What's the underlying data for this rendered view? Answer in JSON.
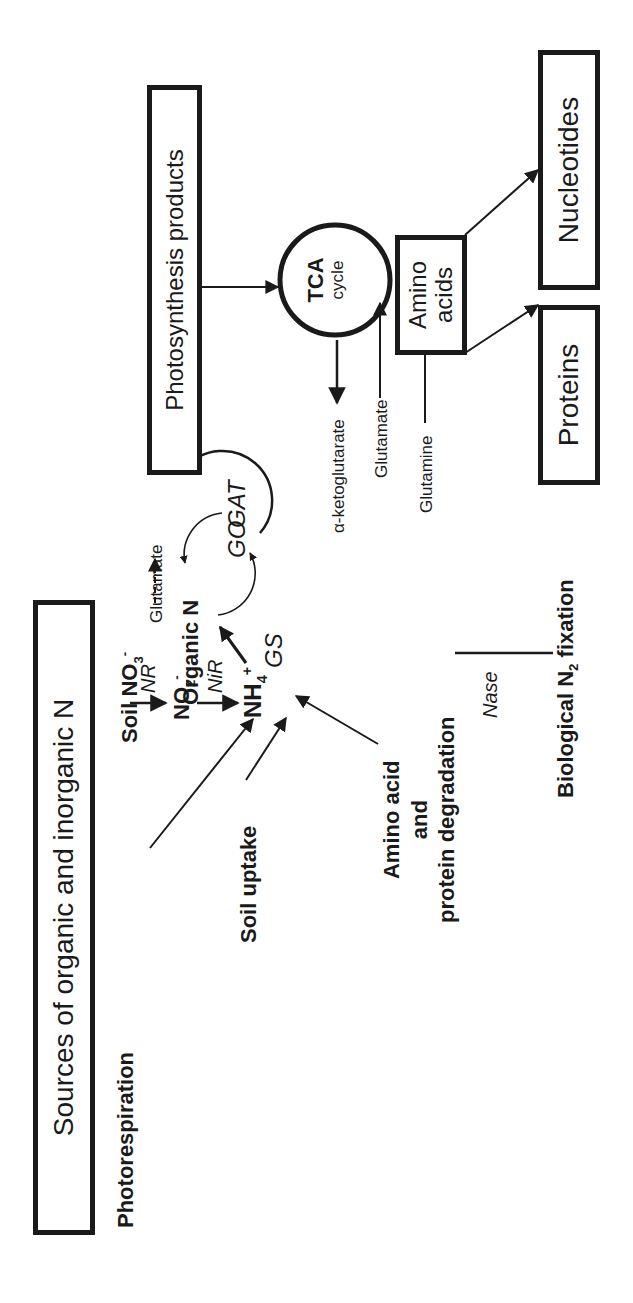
{
  "diagram": {
    "orientation": "rotated 90 degrees counter-clockwise",
    "header_box": "Sources of organic and inorganic N",
    "sources": {
      "photorespiration": "Photorespiration",
      "soil_no3": "Soil NO",
      "soil_no3_sub": "3",
      "soil_no3_sup": "-",
      "organic_n": "Organic N",
      "soil_uptake": "Soil uptake",
      "aa_degradation_line1": "Amino acid",
      "aa_degradation_line2": "and",
      "aa_degradation_line3": "protein degradation",
      "n2_fixation_pre": "Biological N",
      "n2_fixation_sub": "2",
      "n2_fixation_post": " fixation"
    },
    "intermediates": {
      "no2": "NO",
      "no2_sub": "2",
      "no2_sup": "-",
      "nh4": "NH",
      "nh4_sub": "4",
      "nh4_sup": "+",
      "glutamate_left": "Glutamate",
      "glutamine": "Glutamine",
      "alpha_ketoglutarate": "α-ketoglutarate",
      "glutamate_right": "Glutamate"
    },
    "enzymes": {
      "nr": "NR",
      "nir": "NiR",
      "nase": "Nase",
      "gs": "GS",
      "gogat_go": "GO",
      "gogat_gat": "GAT"
    },
    "right_side": {
      "photosynthesis_box": "Photosynthesis products",
      "tca_title": "TCA",
      "tca_sub": "cycle",
      "amino_acids_line1": "Amino",
      "amino_acids_line2": "acids",
      "proteins_box": "Proteins",
      "nucleotides_box": "Nucleotides"
    },
    "colors": {
      "ink": "#1a1a1a",
      "background": "#ffffff"
    }
  }
}
